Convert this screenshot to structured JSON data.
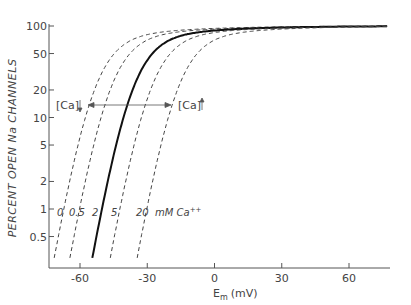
{
  "chart_data": {
    "type": "line",
    "title": "",
    "xlabel": "E_m (mV)",
    "xlabel_main": "E",
    "xlabel_sub": "m",
    "xlabel_unit": "(mV)",
    "ylabel": "PERCENT OPEN Na CHANNELS",
    "yscale": "log",
    "xlim": [
      -72,
      78
    ],
    "ylim": [
      0.28,
      100
    ],
    "x_ticks": [
      -60,
      -30,
      0,
      30,
      60
    ],
    "x_tick_labels": [
      "-60",
      "-30",
      "0",
      "30",
      "60"
    ],
    "y_ticks": [
      100,
      50,
      20,
      10,
      5,
      2,
      1,
      0.5
    ],
    "y_tick_labels": [
      "100",
      "50",
      "20",
      "10",
      "5",
      "2",
      "1",
      "0.5"
    ],
    "grid": false,
    "legend": "inline curve labels at bottom",
    "series": [
      {
        "name": "0 mM Ca++",
        "label": "0",
        "style": "dashed",
        "shift_mV": -17,
        "x": [
          -70,
          -60,
          -50,
          -40,
          -30,
          -20,
          0,
          30,
          60,
          77
        ],
        "y": [
          0.3,
          2.5,
          18,
          50,
          70,
          80,
          90,
          95,
          97,
          98
        ]
      },
      {
        "name": "0.5 mM Ca++",
        "label": "0.5",
        "style": "dashed",
        "shift_mV": -10,
        "x": [
          -62,
          -55,
          -50,
          -40,
          -30,
          -20,
          0,
          30,
          60,
          77
        ],
        "y": [
          0.3,
          1.8,
          6,
          30,
          58,
          72,
          86,
          93,
          96,
          97
        ]
      },
      {
        "name": "2 mM Ca++",
        "label": "2",
        "style": "solid",
        "shift_mV": 0,
        "x": [
          -56,
          -50,
          -45,
          -40,
          -30,
          -20,
          0,
          30,
          60,
          77
        ],
        "y": [
          0.28,
          1.2,
          5,
          18,
          45,
          62,
          80,
          90,
          94,
          95
        ]
      },
      {
        "name": "5 mM Ca++",
        "label": "5",
        "style": "dashed",
        "shift_mV": 8,
        "x": [
          -48,
          -40,
          -35,
          -30,
          -20,
          -10,
          0,
          30,
          60,
          77
        ],
        "y": [
          0.3,
          2,
          6,
          16,
          42,
          60,
          72,
          86,
          91,
          93
        ]
      },
      {
        "name": "20 mM Ca++",
        "label": "20",
        "style": "dashed",
        "shift_mV": 20,
        "x": [
          -36,
          -30,
          -25,
          -20,
          -10,
          0,
          15,
          30,
          60,
          77
        ],
        "y": [
          0.28,
          1.2,
          4,
          12,
          35,
          55,
          68,
          76,
          84,
          88
        ]
      }
    ],
    "annotations": [
      {
        "text": "[Ca]",
        "arrow": "down",
        "x_mV": -60,
        "y": 13
      },
      {
        "text": "[Ca]",
        "arrow": "up",
        "x_mV": -20,
        "y": 13
      },
      {
        "text": "double-headed horizontal arrow",
        "from_mV": -56,
        "to_mV": -20,
        "y": 13
      }
    ],
    "curve_label_suffix": "mM Ca++"
  },
  "labels": {
    "curve_0": "0",
    "curve_05": "0.5",
    "curve_2": "2",
    "curve_5": "5",
    "curve_20": "20",
    "unit_text": "mM Ca",
    "unit_sup": "++",
    "ca_left": "[Ca]",
    "ca_right": "[Ca]"
  }
}
